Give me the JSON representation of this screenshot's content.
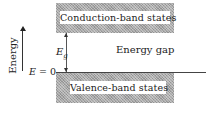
{
  "diagram": {
    "conduction_band_label": "Conduction-band states",
    "valence_band_label": "Valence-band states",
    "gap_label": "Energy gap",
    "gap_symbol": "E",
    "gap_symbol_subscript": "g",
    "zero_label_var": "E",
    "zero_label_eq": " = 0",
    "axis_label": "Energy",
    "band_fill_color": "#a8a8a8",
    "line_color": "#444444"
  }
}
